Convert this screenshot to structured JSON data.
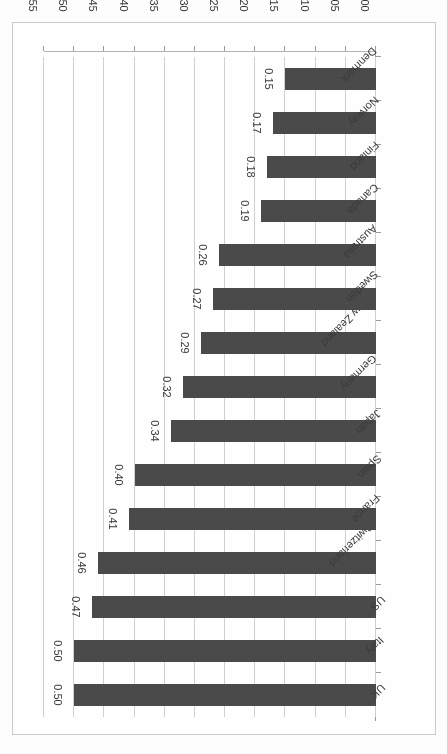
{
  "chart_data": {
    "type": "bar",
    "orientation": "horizontal",
    "title": "",
    "subtitle": "",
    "xlabel": "",
    "ylabel": "",
    "xlim": [
      0.0,
      0.55
    ],
    "grid": true,
    "legend": null,
    "legend_position": "none",
    "page_rotation_degrees": 180,
    "bar_color": "#4a4a4a",
    "gridline_color": "#cfcfcf",
    "axis_color": "#9a9a9a",
    "background_color": "#fefefe",
    "tick_labels": [
      "0.00",
      "0.05",
      "0.10",
      "0.15",
      "0.20",
      "0.25",
      "0.30",
      "0.35",
      "0.40",
      "0.45",
      "0.50",
      "0.55"
    ],
    "tick_values": [
      0.0,
      0.05,
      0.1,
      0.15,
      0.2,
      0.25,
      0.3,
      0.35,
      0.4,
      0.45,
      0.5,
      0.55
    ],
    "categories": [
      "UK",
      "Italy",
      "US",
      "Switzerland",
      "France",
      "Spain",
      "Japan",
      "Germany",
      "New Zealand",
      "Sweden",
      "Australia",
      "Canada",
      "Finland",
      "Norway",
      "Denmark"
    ],
    "values": [
      0.5,
      0.5,
      0.47,
      0.46,
      0.41,
      0.4,
      0.34,
      0.32,
      0.29,
      0.27,
      0.26,
      0.19,
      0.18,
      0.17,
      0.15
    ],
    "value_labels": [
      "0.50",
      "0.50",
      "0.47",
      "0.46",
      "0.41",
      "0.40",
      "0.34",
      "0.32",
      "0.29",
      "0.27",
      "0.26",
      "0.19",
      "0.18",
      "0.17",
      "0.15"
    ]
  }
}
